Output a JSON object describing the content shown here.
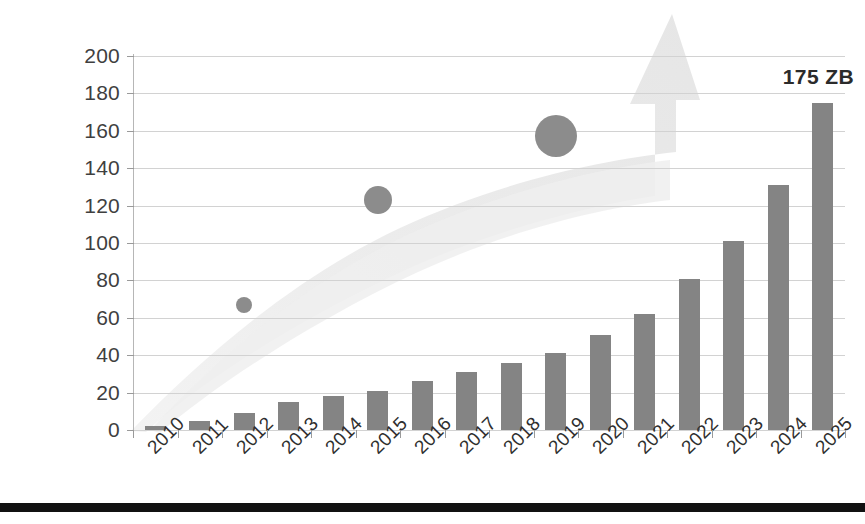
{
  "chart_data": {
    "type": "bar",
    "title": "",
    "subtitle": "",
    "xlabel": "",
    "ylabel": "Zetabytes",
    "ylim": [
      0,
      200
    ],
    "ytick_step": 20,
    "grid": true,
    "legend": false,
    "categories": [
      "2010",
      "2011",
      "2012",
      "2013",
      "2014",
      "2015",
      "2016",
      "2017",
      "2018",
      "2019",
      "2020",
      "2021",
      "2022",
      "2023",
      "2024",
      "2025"
    ],
    "values": [
      2,
      5,
      9,
      15,
      18,
      21,
      26,
      31,
      36,
      41,
      51,
      62,
      81,
      101,
      131,
      175
    ],
    "ytick_labels": [
      "200",
      "180",
      "160",
      "140",
      "120",
      "100",
      "80",
      "60",
      "40",
      "20",
      "0"
    ],
    "annotations": [
      {
        "text": "175 ZB",
        "category": "2025",
        "value": 175
      }
    ],
    "markers": [
      {
        "category": "2012",
        "value": 67,
        "size": "small"
      },
      {
        "category": "2015",
        "value": 123,
        "size": "medium"
      },
      {
        "category": "2019",
        "value": 157,
        "size": "large"
      }
    ],
    "decorations": [
      {
        "name": "growth-arrow",
        "description": "light grey upward swoosh arrow from origin to top right"
      }
    ],
    "colors": {
      "bar": "#848484",
      "marker": "#8c8c8c",
      "arrow": "#ececec",
      "grid": "#d2d2d2",
      "text": "#2f2f2f",
      "rule": "#111111"
    }
  }
}
